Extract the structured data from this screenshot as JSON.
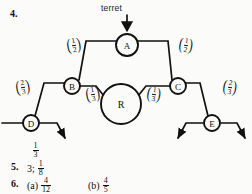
{
  "page": {
    "background": "#fbfbfa",
    "ink": "#111111"
  },
  "question_numbers": {
    "q4": "4.",
    "q5": "5.",
    "q6": "6."
  },
  "diagram": {
    "title_label": "terret",
    "arrow_into_a": "down-arrow",
    "nodes": [
      {
        "id": "A",
        "label": "A",
        "cx": 127,
        "cy": 45,
        "r": 11
      },
      {
        "id": "B",
        "label": "B",
        "cx": 72,
        "cy": 86,
        "r": 8
      },
      {
        "id": "C",
        "label": "C",
        "cx": 178,
        "cy": 86,
        "r": 8
      },
      {
        "id": "D",
        "label": "D",
        "cx": 31,
        "cy": 123,
        "r": 8
      },
      {
        "id": "E",
        "label": "E",
        "cx": 212,
        "cy": 123,
        "r": 8
      },
      {
        "id": "R",
        "label": "R",
        "cx": 121,
        "cy": 104,
        "r": 20
      }
    ],
    "edge_labels": [
      {
        "id": "ab",
        "numerator": "1",
        "denominator": "2",
        "x": 71,
        "y": 46
      },
      {
        "id": "ac",
        "numerator": "1",
        "denominator": "2",
        "x": 165,
        "y": 46
      },
      {
        "id": "db",
        "numerator": "2",
        "denominator": "3",
        "x": 24,
        "y": 87
      },
      {
        "id": "ce",
        "numerator": "2",
        "denominator": "3",
        "x": 212,
        "y": 87
      },
      {
        "id": "br_left",
        "numerator": "1",
        "denominator": "3",
        "x": 91,
        "y": 93
      },
      {
        "id": "cr_right",
        "numerator": "1",
        "denominator": "3",
        "x": 150,
        "y": 93
      }
    ]
  },
  "answers": {
    "stray_fraction": {
      "numerator": "1",
      "denominator": "3"
    },
    "answer5": {
      "whole": "3",
      "separator": ";",
      "fraction": {
        "numerator": "1",
        "denominator": "8"
      }
    },
    "answer6a": {
      "label": "(a)",
      "fraction": {
        "numerator": "4",
        "denominator": "12"
      }
    },
    "answer6b": {
      "label": "(b)",
      "fraction": {
        "numerator": "4",
        "denominator": "5"
      }
    }
  }
}
